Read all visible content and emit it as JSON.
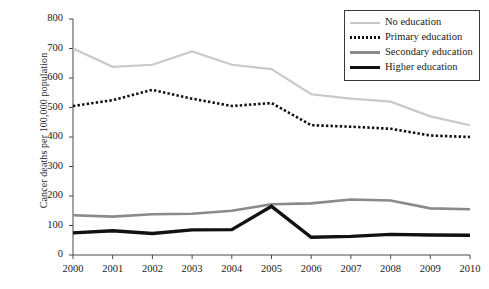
{
  "chart_data": {
    "type": "line",
    "title": "",
    "subtitle": "",
    "xlabel": "",
    "ylabel": "Cancer deaths per 100,000 population",
    "x": [
      2000,
      2001,
      2002,
      2003,
      2004,
      2005,
      2006,
      2007,
      2008,
      2009,
      2010
    ],
    "xtick_labels": [
      "2000",
      "2001",
      "2002",
      "2003",
      "2004",
      "2005",
      "2006",
      "2007",
      "2008",
      "2009",
      "2010"
    ],
    "ytick_labels": [
      "0",
      "100",
      "200",
      "300",
      "400",
      "500",
      "600",
      "700",
      "800"
    ],
    "ytick_values": [
      0,
      100,
      200,
      300,
      400,
      500,
      600,
      700,
      800
    ],
    "xlim": [
      2000,
      2010
    ],
    "ylim": [
      0,
      800
    ],
    "grid": false,
    "legend_position": "top-right",
    "series": [
      {
        "name": "No education",
        "values": [
          700,
          638,
          645,
          690,
          645,
          630,
          545,
          530,
          520,
          470,
          440
        ],
        "color": "#c9c9c9",
        "style": "solid",
        "width": 2.2
      },
      {
        "name": "Primary education",
        "values": [
          505,
          525,
          560,
          530,
          505,
          515,
          440,
          435,
          428,
          405,
          400
        ],
        "color": "#111111",
        "style": "dotted",
        "width": 2.6
      },
      {
        "name": "Secondary education",
        "values": [
          135,
          130,
          138,
          140,
          150,
          172,
          175,
          188,
          185,
          158,
          155
        ],
        "color": "#8a8a8a",
        "style": "solid",
        "width": 2.6
      },
      {
        "name": "Higher education",
        "values": [
          75,
          82,
          73,
          85,
          86,
          165,
          60,
          63,
          70,
          68,
          67
        ],
        "color": "#111111",
        "style": "solid",
        "width": 3.4
      }
    ]
  },
  "legend": {
    "items": [
      {
        "label": "No education"
      },
      {
        "label": "Primary education"
      },
      {
        "label": "Secondary education"
      },
      {
        "label": "Higher education"
      }
    ]
  }
}
